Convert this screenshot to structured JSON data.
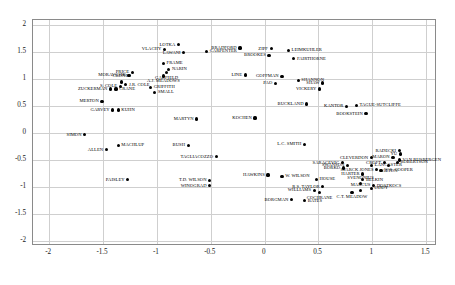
{
  "chart_data": {
    "type": "scatter",
    "title": "",
    "xlabel": "",
    "ylabel": "",
    "xlim": [
      -2.15,
      1.6
    ],
    "ylim": [
      -2.1,
      2.1
    ],
    "grid": true,
    "legend": "none",
    "xticks": [
      "-2",
      "-1.5",
      "-1",
      "-0.5",
      "0",
      "0.5",
      "1",
      "1.5"
    ],
    "xtickvals": [
      -2,
      -1.5,
      -1,
      -0.5,
      0,
      0.5,
      1,
      1.5
    ],
    "yticks": [
      "2",
      "1.5",
      "1",
      "0.5",
      "0",
      "-0.5",
      "-1",
      "-1.5",
      "-2"
    ],
    "ytickvals": [
      2,
      1.5,
      1,
      0.5,
      0,
      -0.5,
      -1,
      -1.5,
      -2
    ],
    "points": [
      {
        "label": "LOTKA",
        "x": -0.79,
        "y": 1.62,
        "side": "ll"
      },
      {
        "label": "VLACHY",
        "x": -0.92,
        "y": 1.54,
        "side": "ll"
      },
      {
        "label": "LAWANI",
        "x": -0.74,
        "y": 1.47,
        "side": "ll"
      },
      {
        "label": "CARPENTER",
        "x": -0.53,
        "y": 1.5,
        "side": "lr"
      },
      {
        "label": "BRADFORD",
        "x": -0.22,
        "y": 1.56,
        "side": "ll"
      },
      {
        "label": "ZIPF",
        "x": 0.07,
        "y": 1.55,
        "side": "ll"
      },
      {
        "label": "LEIMKUHLER",
        "x": 0.23,
        "y": 1.52,
        "side": "lr"
      },
      {
        "label": "BROOKES",
        "x": 0.05,
        "y": 1.42,
        "side": "ll"
      },
      {
        "label": "FAIRTHORNE",
        "x": 0.28,
        "y": 1.36,
        "side": "lr"
      },
      {
        "label": "FRAME",
        "x": -0.93,
        "y": 1.28,
        "side": "lr"
      },
      {
        "label": "NARIN",
        "x": -0.88,
        "y": 1.16,
        "side": "lr"
      },
      {
        "label": "GARFIELD",
        "x": -0.9,
        "y": 1.1,
        "side": "lb"
      },
      {
        "label": "A.J. MEADOWS",
        "x": -0.93,
        "y": 1.04,
        "side": "lb"
      },
      {
        "label": "PRICE",
        "x": -1.22,
        "y": 1.11,
        "side": "ll"
      },
      {
        "label": "MORAVCSIK",
        "x": -1.25,
        "y": 1.05,
        "side": "ll"
      },
      {
        "label": "LINE",
        "x": -0.17,
        "y": 1.06,
        "side": "ll"
      },
      {
        "label": "GOFFMAN",
        "x": 0.17,
        "y": 1.03,
        "side": "ll"
      },
      {
        "label": "SHANNON",
        "x": 0.32,
        "y": 0.96,
        "side": "lr"
      },
      {
        "label": "SHAW",
        "x": 0.55,
        "y": 0.91,
        "side": "ll"
      },
      {
        "label": "PAO",
        "x": 0.11,
        "y": 0.9,
        "side": "ll"
      },
      {
        "label": "CRONIN",
        "x": -1.32,
        "y": 0.93,
        "side": "lt"
      },
      {
        "label": "J.R. COLE",
        "x": -1.28,
        "y": 0.88,
        "side": "lr"
      },
      {
        "label": "S. COLE",
        "x": -1.33,
        "y": 0.85,
        "side": "ll"
      },
      {
        "label": "GRIFFITH",
        "x": -1.05,
        "y": 0.83,
        "side": "lr"
      },
      {
        "label": "ZUCKERMAN",
        "x": -1.42,
        "y": 0.8,
        "side": "ll"
      },
      {
        "label": "CRANE",
        "x": -1.37,
        "y": 0.8,
        "side": "lr"
      },
      {
        "label": "SMALL",
        "x": -1.01,
        "y": 0.74,
        "side": "lr"
      },
      {
        "label": "VICKERY",
        "x": 0.52,
        "y": 0.8,
        "side": "ll"
      },
      {
        "label": "MERTON",
        "x": -1.5,
        "y": 0.57,
        "side": "ll"
      },
      {
        "label": "GARVEY",
        "x": -1.4,
        "y": 0.41,
        "side": "ll"
      },
      {
        "label": "KUHN",
        "x": -1.35,
        "y": 0.41,
        "side": "lr"
      },
      {
        "label": "BUCKLAND",
        "x": 0.4,
        "y": 0.52,
        "side": "ll"
      },
      {
        "label": "KANTOR",
        "x": 0.77,
        "y": 0.48,
        "side": "ll"
      },
      {
        "label": "TAGUE-SUTCLIFFE",
        "x": 0.86,
        "y": 0.5,
        "side": "lr"
      },
      {
        "label": "BOOKSTEIN",
        "x": 0.95,
        "y": 0.34,
        "side": "ll"
      },
      {
        "label": "MARTYN",
        "x": -0.62,
        "y": 0.24,
        "side": "ll"
      },
      {
        "label": "KOCHEN",
        "x": -0.08,
        "y": 0.26,
        "side": "ll"
      },
      {
        "label": "SIMON",
        "x": -1.66,
        "y": -0.05,
        "side": "ll"
      },
      {
        "label": "MACHLUP",
        "x": -1.35,
        "y": -0.25,
        "side": "lr"
      },
      {
        "label": "ALLEN",
        "x": -1.46,
        "y": -0.33,
        "side": "ll"
      },
      {
        "label": "BUSH",
        "x": -0.7,
        "y": -0.25,
        "side": "ll"
      },
      {
        "label": "L.C. SMITH",
        "x": 0.38,
        "y": -0.23,
        "side": "ll"
      },
      {
        "label": "RADECKI",
        "x": 1.26,
        "y": -0.35,
        "side": "ll"
      },
      {
        "label": "YU",
        "x": 1.27,
        "y": -0.41,
        "side": "ll"
      },
      {
        "label": "MARON",
        "x": 1.2,
        "y": -0.47,
        "side": "ll"
      },
      {
        "label": "CLEVERDON",
        "x": 1.0,
        "y": -0.48,
        "side": "ll"
      },
      {
        "label": "VAN RIJSBERGEN",
        "x": 1.26,
        "y": -0.52,
        "side": "lr"
      },
      {
        "label": "ROBERTSON",
        "x": 1.24,
        "y": -0.56,
        "side": "lr"
      },
      {
        "label": "CROFT",
        "x": 1.12,
        "y": -0.57,
        "side": "ll"
      },
      {
        "label": "SALTON",
        "x": 1.16,
        "y": -0.62,
        "side": "lb"
      },
      {
        "label": "LANCASTER",
        "x": 1.0,
        "y": -0.62,
        "side": "lr"
      },
      {
        "label": "TAGLIACOZZO",
        "x": -0.44,
        "y": -0.46,
        "side": "ll"
      },
      {
        "label": "SARACEVIC",
        "x": 0.73,
        "y": -0.57,
        "side": "ll"
      },
      {
        "label": "SWANSON",
        "x": 0.78,
        "y": -0.62,
        "side": "ll"
      },
      {
        "label": "BORKO",
        "x": 0.74,
        "y": -0.67,
        "side": "ll"
      },
      {
        "label": "SPARCK JONES",
        "x": 1.05,
        "y": -0.7,
        "side": "ll"
      },
      {
        "label": "W.S. COOPER",
        "x": 1.09,
        "y": -0.71,
        "side": "lr"
      },
      {
        "label": "HARTER",
        "x": 0.92,
        "y": -0.78,
        "side": "ll"
      },
      {
        "label": "PAISLEY",
        "x": -1.26,
        "y": -0.89,
        "side": "ll"
      },
      {
        "label": "HAWKINS",
        "x": 0.04,
        "y": -0.8,
        "side": "ll"
      },
      {
        "label": "W. WILSON",
        "x": 0.17,
        "y": -0.82,
        "side": "lr"
      },
      {
        "label": "T.D. WILSON",
        "x": -0.5,
        "y": -0.9,
        "side": "ll"
      },
      {
        "label": "HOUSE",
        "x": 0.49,
        "y": -0.88,
        "side": "lr"
      },
      {
        "label": "BELKIN",
        "x": 0.92,
        "y": -0.89,
        "side": "lr"
      },
      {
        "label": "WINOGRAD",
        "x": -0.5,
        "y": -1.0,
        "side": "ll"
      },
      {
        "label": "SVENONIUS",
        "x": 0.9,
        "y": -0.96,
        "side": "lt"
      },
      {
        "label": "DOSZKOCS",
        "x": 1.02,
        "y": -1.0,
        "side": "lr"
      },
      {
        "label": "R.S. TAYLOR",
        "x": 0.55,
        "y": -1.02,
        "side": "ll"
      },
      {
        "label": "ODDY",
        "x": 1.0,
        "y": -1.05,
        "side": "lr"
      },
      {
        "label": "WILLIAMS",
        "x": 0.47,
        "y": -1.08,
        "side": "ll"
      },
      {
        "label": "MARCUS",
        "x": 0.9,
        "y": -1.08,
        "side": "lt"
      },
      {
        "label": "C.T. MEADOW",
        "x": 0.82,
        "y": -1.12,
        "side": "lb"
      },
      {
        "label": "COCHRANE",
        "x": 0.52,
        "y": -1.13,
        "side": "lb"
      },
      {
        "label": "BORGMAN",
        "x": 0.26,
        "y": -1.26,
        "side": "ll"
      },
      {
        "label": "BATES",
        "x": 0.38,
        "y": -1.28,
        "side": "lr"
      }
    ]
  }
}
